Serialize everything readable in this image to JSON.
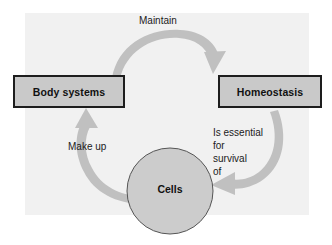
{
  "diagram": {
    "type": "cycle",
    "panel_color": "#f1f1f1",
    "arrow_color": "#c0c0c0",
    "node_fill": "#c9c9c9",
    "node_border": "#1d1d1d",
    "text_color": "#1b1b1b",
    "nodes": [
      {
        "id": "body-systems",
        "shape": "rectangle",
        "label": "Body systems"
      },
      {
        "id": "homeostasis",
        "shape": "rectangle",
        "label": "Homeostasis"
      },
      {
        "id": "cells",
        "shape": "circle",
        "label": "Cells"
      }
    ],
    "edges": [
      {
        "id": "body-to-homeostasis",
        "from": "body-systems",
        "to": "homeostasis",
        "label": "Maintain",
        "direction": "clockwise-top"
      },
      {
        "id": "homeostasis-to-cells",
        "from": "homeostasis",
        "to": "cells",
        "label_lines": [
          "Is essential",
          "for",
          "survival",
          "of"
        ],
        "direction": "clockwise-right"
      },
      {
        "id": "cells-to-body",
        "from": "cells",
        "to": "body-systems",
        "label": "Make up",
        "direction": "clockwise-left"
      }
    ]
  }
}
